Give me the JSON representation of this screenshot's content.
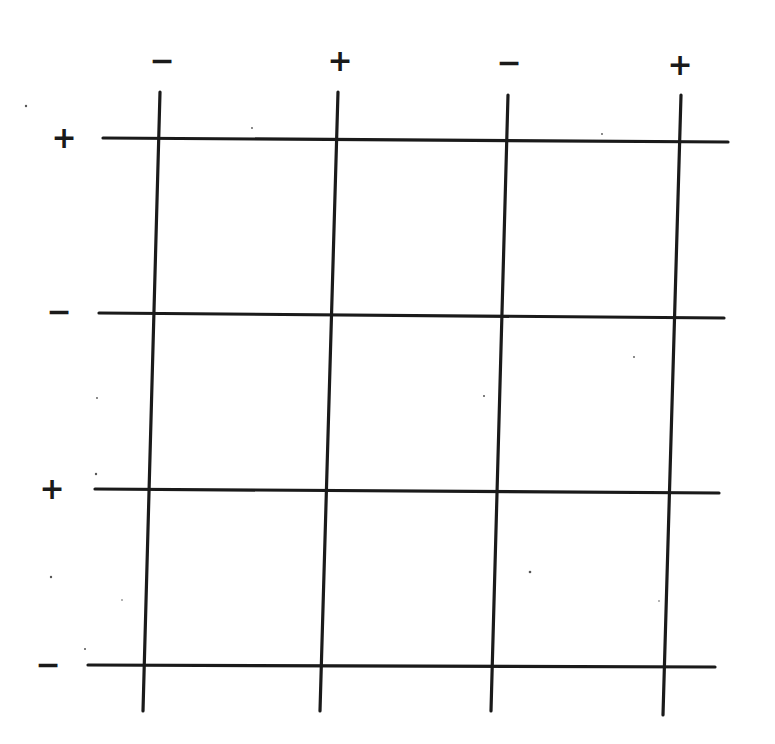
{
  "diagram": {
    "line_color": "#1a1a1a",
    "background": "#ffffff",
    "column_labels": [
      {
        "text": "−",
        "x": 162,
        "y": 60
      },
      {
        "text": "+",
        "x": 340,
        "y": 60
      },
      {
        "text": "−",
        "x": 509,
        "y": 62
      },
      {
        "text": "+",
        "x": 680,
        "y": 64
      }
    ],
    "row_labels": [
      {
        "text": "+",
        "x": 64,
        "y": 137
      },
      {
        "text": "−",
        "x": 59,
        "y": 311
      },
      {
        "text": "+",
        "x": 52,
        "y": 488
      },
      {
        "text": "−",
        "x": 48,
        "y": 664
      }
    ],
    "vertical_lines": [
      {
        "x1": 160,
        "y1": 92,
        "x2": 143,
        "y2": 711
      },
      {
        "x1": 338,
        "y1": 92,
        "x2": 320,
        "y2": 711
      },
      {
        "x1": 508,
        "y1": 95,
        "x2": 491,
        "y2": 711
      },
      {
        "x1": 681,
        "y1": 95,
        "x2": 663,
        "y2": 715
      }
    ],
    "horizontal_lines": [
      {
        "x1": 103,
        "y1": 138,
        "x2": 728,
        "y2": 142
      },
      {
        "x1": 99,
        "y1": 313,
        "x2": 724,
        "y2": 318
      },
      {
        "x1": 95,
        "y1": 489,
        "x2": 719,
        "y2": 493
      },
      {
        "x1": 88,
        "y1": 665,
        "x2": 715,
        "y2": 667
      }
    ]
  }
}
